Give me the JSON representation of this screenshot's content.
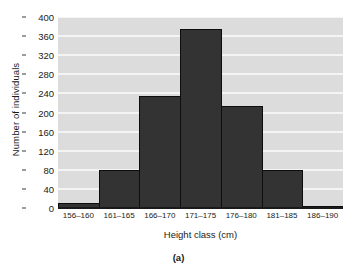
{
  "chart_data": {
    "type": "bar",
    "title": "",
    "subtitle": "",
    "categories": [
      "156–160",
      "161–165",
      "166–170",
      "171–175",
      "176–180",
      "181–185",
      "186–190"
    ],
    "values": [
      10,
      80,
      235,
      375,
      213,
      80,
      5
    ],
    "xlabel": "Height class (cm)",
    "ylabel": "Number of individuals",
    "ylim": [
      0,
      400
    ],
    "yticks": [
      0,
      40,
      80,
      120,
      160,
      200,
      240,
      280,
      320,
      360,
      400
    ],
    "grid": true,
    "legend": "none",
    "caption": "(a)",
    "bar_color": "#333333",
    "plot_background": "#dcdcdc",
    "gridline_color": "#f4f4f4",
    "axis_color": "#1a1a1a"
  }
}
